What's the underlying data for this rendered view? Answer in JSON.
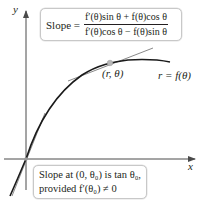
{
  "axes": {
    "x_label": "x",
    "y_label": "y"
  },
  "curve": {
    "label": "r = f(θ)",
    "point_label": "(r, θ)"
  },
  "top_box": {
    "slope_label": "Slope =",
    "numerator": "f′(θ)sin θ + f(θ)cos θ",
    "denominator": "f′(θ)cos θ − f(θ)sin θ"
  },
  "bottom_box": {
    "line1": "Slope at (0, θ₀) is tan θ₀,",
    "line2": "provided f′(θ₀) ≠ 0"
  },
  "colors": {
    "axis": "#4a4a4a",
    "curve": "#1a1a1a",
    "tangent": "#8a8a8a",
    "point": "#b8b8b8",
    "box_border": "#c8c8c8"
  }
}
